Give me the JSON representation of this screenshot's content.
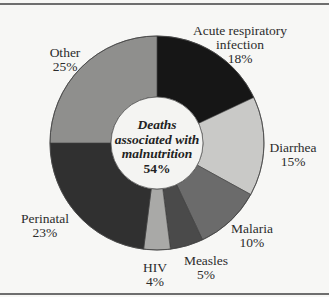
{
  "chart_data": {
    "type": "pie",
    "variant": "donut",
    "title": "",
    "center_label": {
      "lines": [
        "Deaths",
        "associated with",
        "malnutrition"
      ],
      "value": "54%"
    },
    "categories": [
      "Acute respiratory infection",
      "Diarrhea",
      "Malaria",
      "Measles",
      "HIV",
      "Perinatal",
      "Other"
    ],
    "values": [
      18,
      15,
      10,
      5,
      4,
      23,
      25
    ],
    "unit": "%",
    "colors": [
      "#161616",
      "#c9c9c7",
      "#6b6b6b",
      "#4a4a4a",
      "#a9a9a7",
      "#303030",
      "#8f8f8d"
    ],
    "start_angle_deg": -90,
    "direction": "clockwise",
    "legend": "none (direct labels)"
  },
  "labels": [
    {
      "lines": [
        "Acute respiratory",
        "infection",
        "18%"
      ],
      "x": 240,
      "y": 24
    },
    {
      "lines": [
        "Diarrhea",
        "15%"
      ],
      "x": 293,
      "y": 141
    },
    {
      "lines": [
        "Malaria",
        "10%"
      ],
      "x": 252,
      "y": 222
    },
    {
      "lines": [
        "Measles",
        "5%"
      ],
      "x": 206,
      "y": 254
    },
    {
      "lines": [
        "HIV",
        "4%"
      ],
      "x": 155,
      "y": 261
    },
    {
      "lines": [
        "Perinatal",
        "23%"
      ],
      "x": 45,
      "y": 212
    },
    {
      "lines": [
        "Other",
        "25%"
      ],
      "x": 65,
      "y": 46
    }
  ]
}
